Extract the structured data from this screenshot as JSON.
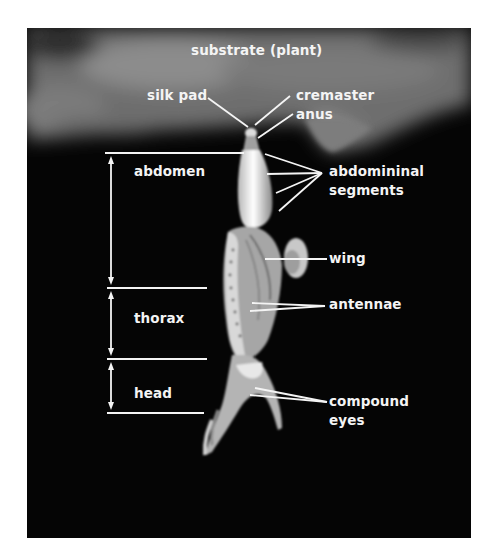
{
  "figure": {
    "background_color": "#050505",
    "annotation_color": "#f4f4f4"
  },
  "labels": {
    "substrate": "substrate (plant)",
    "silk_pad": "silk pad",
    "cremaster": "cremaster",
    "anus": "anus",
    "abdomen": "abdomen",
    "abdominal_segments_line1": "abdomininal",
    "abdominal_segments_line2": "segments",
    "wing": "wing",
    "thorax": "thorax",
    "antennae": "antennae",
    "head": "head",
    "compound_eyes_line1": "compound",
    "compound_eyes_line2": "eyes"
  },
  "regions": [
    {
      "name": "abdomen",
      "top_y": 153,
      "bottom_y": 287
    },
    {
      "name": "thorax",
      "top_y": 288,
      "bottom_y": 359
    },
    {
      "name": "head",
      "top_y": 360,
      "bottom_y": 413
    }
  ]
}
